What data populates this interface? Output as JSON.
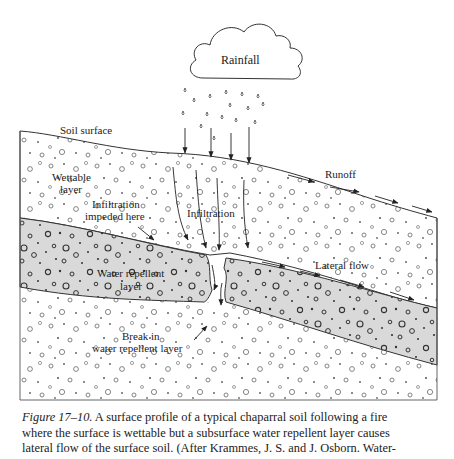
{
  "figure": {
    "labels": {
      "rainfall": "Rainfall",
      "soil_surface": "Soil surface",
      "runoff": "Runoff",
      "wettable_layer_line1": "Wettable",
      "wettable_layer_line2": "layer",
      "infiltration_impeded_line1": "Infiltration",
      "infiltration_impeded_line2": "impeded here",
      "infiltration": "Infiltration",
      "lateral_flow": "Lateral flow",
      "water_repellent_line1": "Water repellent",
      "water_repellent_line2": "layer",
      "break_line1": "Break in",
      "break_line2": "water repellent layer"
    },
    "colors": {
      "repellent_layer_fill": "#d9d9d9",
      "outline": "#333333",
      "background": "#ffffff"
    }
  },
  "caption": {
    "figure_number": "Figure 17–10.",
    "line1_rest": " A surface profile of a typical chaparral soil following a fire",
    "line2": "where the surface is wettable but a subsurface water repellent layer causes",
    "line3": "lateral flow of the surface soil. (After Krammes, J. S. and J. Osborn. Water-"
  }
}
